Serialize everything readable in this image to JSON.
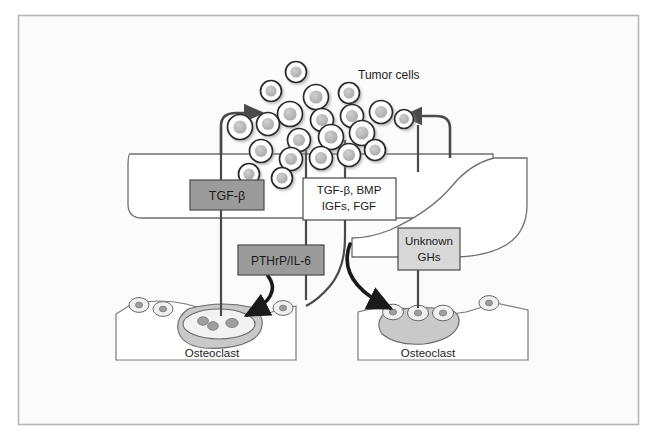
{
  "figure": {
    "frame_color": "#b0b0b0",
    "background_color": "#fbfbfb",
    "panel_fill": "#ffffff",
    "panel_stroke": "#6f6f6f"
  },
  "labels": {
    "tumor_cells": "Tumor cells",
    "osteoclast_left": "Osteoclast",
    "osteoclast_right": "Osteoclast"
  },
  "boxes": [
    {
      "id": "tgf-beta",
      "text": "TGF-β",
      "fill": "#9b9b9b",
      "stroke": "#4a4a4a",
      "text_color": "#111111",
      "lines": [
        "TGF-β"
      ]
    },
    {
      "id": "pthrp-il6",
      "text": "PTHrP/IL-6",
      "fill": "#9b9b9b",
      "stroke": "#4a4a4a",
      "text_color": "#111111",
      "lines": [
        "PTHrP/IL-6"
      ]
    },
    {
      "id": "growth-factors",
      "text": "TGF-β, BMP IGFs, FGF",
      "fill": "#fdfdfd",
      "stroke": "#4a4a4a",
      "text_color": "#111111",
      "lines": [
        "TGF-β, BMP",
        "IGFs, FGF"
      ]
    },
    {
      "id": "unknown-ghs",
      "text": "Unknown GHs",
      "fill": "#d8d8d8",
      "stroke": "#4a4a4a",
      "text_color": "#111111",
      "lines": [
        "Unknown",
        "GHs"
      ]
    }
  ],
  "cells": {
    "tumor_cell_fill": "#ffffff",
    "tumor_cell_stroke": "#2b2b2b",
    "tumor_nucleus_fill": "#b8b8b8",
    "osteoblast_fill": "#f0f0f0",
    "osteoblast_stroke": "#6a6a6a",
    "osteoclast_fill": "#d7d7d7",
    "osteoclast_stroke": "#6a6a6a",
    "bone_fill": "#ffffff",
    "bone_stroke": "#7a7a7a"
  },
  "arrows": {
    "stroke_thin": "#4a4a4a",
    "stroke_thick": "#1a1a1a",
    "to_tumor_left": "TGF-β stimulates tumor cells",
    "to_tumor_right": "Unknown GHs stimulate tumor cells",
    "to_osteoclast_left": "PTHrP/IL-6 stimulates osteoclast",
    "to_osteoclast_right": "Unknown GHs stimulate osteoclast"
  },
  "tumor_cell_positions": [
    {
      "x": 296,
      "y": 72,
      "r": 10.5
    },
    {
      "x": 271,
      "y": 91,
      "r": 10.5
    },
    {
      "x": 316,
      "y": 97,
      "r": 12.5
    },
    {
      "x": 349,
      "y": 93,
      "r": 10.5
    },
    {
      "x": 290,
      "y": 114,
      "r": 12.5
    },
    {
      "x": 322,
      "y": 120,
      "r": 11.5
    },
    {
      "x": 352,
      "y": 116,
      "r": 11.5
    },
    {
      "x": 381,
      "y": 112,
      "r": 11.5
    },
    {
      "x": 404,
      "y": 119,
      "r": 9.5
    },
    {
      "x": 240,
      "y": 127,
      "r": 12.5
    },
    {
      "x": 268,
      "y": 124,
      "r": 11.5
    },
    {
      "x": 299,
      "y": 140,
      "r": 11.5
    },
    {
      "x": 331,
      "y": 137,
      "r": 12.5
    },
    {
      "x": 362,
      "y": 133,
      "r": 12.5
    },
    {
      "x": 261,
      "y": 151,
      "r": 11.5
    },
    {
      "x": 291,
      "y": 159,
      "r": 11.5
    },
    {
      "x": 321,
      "y": 158,
      "r": 11.5
    },
    {
      "x": 349,
      "y": 155,
      "r": 11.5
    },
    {
      "x": 375,
      "y": 150,
      "r": 10.5
    },
    {
      "x": 249,
      "y": 174,
      "r": 10.5
    },
    {
      "x": 282,
      "y": 178,
      "r": 10.5
    }
  ]
}
